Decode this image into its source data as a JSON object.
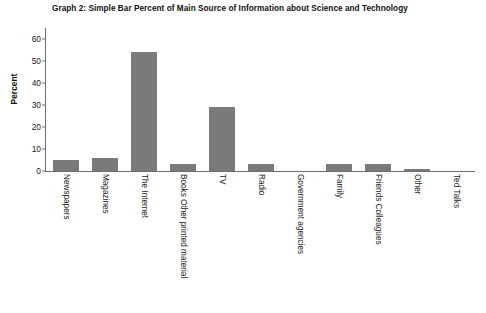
{
  "chart_data": {
    "type": "bar",
    "title": "Graph 2: Simple Bar Percent of Main Source of Information about Science and Technology",
    "xlabel": "",
    "ylabel": "Percent",
    "ylim": [
      0,
      60
    ],
    "yticks": [
      0,
      10,
      20,
      30,
      40,
      50,
      60
    ],
    "ytick_labels": [
      "0",
      "10",
      "20",
      "30",
      "40",
      "50",
      "60"
    ],
    "grid": false,
    "legend": false,
    "bar_color": "#7a7a7a",
    "axis_color": "#6f6f6f",
    "categories": [
      "Newspapers",
      "Magazines",
      "The Internet",
      "Books Other printed material",
      "TV",
      "Radio",
      "Government agencies",
      "Family",
      "Friends Colleagues",
      "Other",
      "Ted Talks"
    ],
    "values": [
      5,
      6,
      54,
      3,
      29,
      3,
      0,
      3,
      3,
      1,
      0
    ],
    "series": [
      {
        "name": "Percent",
        "values": [
          5,
          6,
          54,
          3,
          29,
          3,
          0,
          3,
          3,
          1,
          0
        ]
      }
    ]
  }
}
